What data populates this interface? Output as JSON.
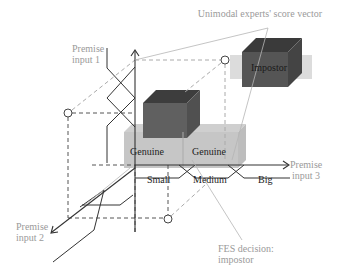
{
  "diagram": {
    "title": "Unimodal experts' score vector",
    "axes": {
      "input1": {
        "line1": "Premise",
        "line2": "input 1"
      },
      "input2": {
        "line1": "Premise",
        "line2": "input 2"
      },
      "input3": {
        "line1": "Premise",
        "line2": "input 3"
      }
    },
    "fuzzy_sets": [
      "Small",
      "Medium",
      "Big"
    ],
    "boxes": {
      "genuine_left": "Genuine",
      "genuine_right": "Genuine",
      "impostor": "Impostor"
    },
    "decision": {
      "line1": "FES decision:",
      "line2": "impostor"
    },
    "colors": {
      "genuine": "#b8b8b8",
      "dark_box": "#5a5a5a",
      "impostor_box": "#4e4e4e",
      "band": "#d9d9d9",
      "axis": "#333333",
      "label_gray": "#9a9a9a"
    }
  }
}
